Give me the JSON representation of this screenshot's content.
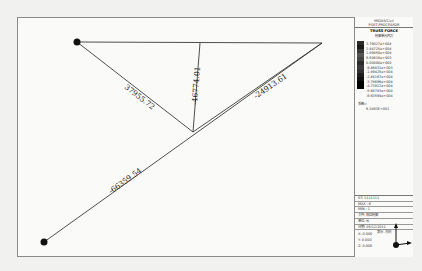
{
  "legend": {
    "header_lines": [
      "MIDAS/Civil",
      "POST-PROCESSOR"
    ],
    "title": "TRUSS FORCE",
    "subtitle": "桁架单元内力",
    "values": [
      "3.79027e+004",
      "2.84725e+004",
      "1.89850e+004",
      "9.50616e+003",
      "0.00000e+000",
      "-9.46831e+003",
      "-1.89425e+004",
      "-2.84167e+004",
      "-3.78696e+004",
      "-4.73922e+004",
      "-5.68783e+004",
      "-6.63594e+004"
    ],
    "scale_colors": [
      "#2a2a2a",
      "#1a1a1a",
      "#3a3a3a",
      "#555555",
      "#444444",
      "#2c2c2c",
      "#3c3c3c",
      "#333333",
      "#1e1e1e",
      "#111111",
      "#000000"
    ],
    "coef_label": "系数=",
    "coef_value": "6.3493E+001"
  },
  "info": {
    "rows": [
      "ST: 1111111",
      "MAX : 6",
      "MIN : 1",
      "文件: 斜拉桁架",
      "单位: N",
      "日期: 05/12/2011"
    ],
    "view_label": "表示-方向",
    "coords": [
      "X: 0.000",
      "Y: 0.000",
      "Z: 0.000"
    ]
  },
  "members": [
    {
      "label": "37955.72",
      "force": 37955.72
    },
    {
      "label": "-46774.01",
      "force": -46774.01
    },
    {
      "label": "-24913.61",
      "force": -24913.61
    },
    {
      "label": "-66359.54",
      "force": -66359.54
    }
  ]
}
